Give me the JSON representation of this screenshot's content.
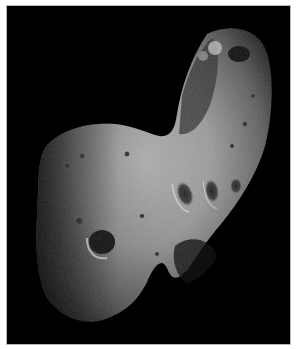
{
  "image": {
    "subject": "asteroid",
    "alt": "Grayscale photograph of an elongated cratered asteroid against a black background",
    "colors": {
      "background": "#000000",
      "frame_border": "#b8b8b8",
      "page": "#ffffff",
      "surface_light": "#c8c8c8",
      "surface_mid": "#8a8a8a",
      "surface_dark": "#3a3a3a"
    }
  }
}
